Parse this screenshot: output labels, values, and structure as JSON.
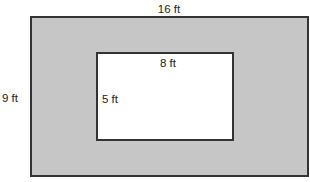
{
  "diagram": {
    "type": "rectangle-within-rectangle",
    "outer_rectangle": {
      "width_label": "16 ft",
      "height_label": "9 ft",
      "fill": "#c6c6c6"
    },
    "inner_rectangle": {
      "width_label": "8 ft",
      "height_label": "5 ft",
      "fill": "#ffffff"
    }
  }
}
